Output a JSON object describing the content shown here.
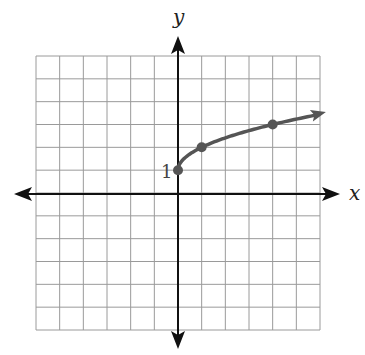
{
  "chart_data": {
    "type": "line",
    "title": "",
    "function": "y = sqrt(x) + 1",
    "xlabel": "x",
    "ylabel": "y",
    "xlim": [
      -6,
      6
    ],
    "ylim": [
      -6,
      6
    ],
    "grid": true,
    "grid_step": 1,
    "tick_labels": [
      {
        "axis": "y",
        "value": 1,
        "label": "1"
      }
    ],
    "series": [
      {
        "name": "curve",
        "x": [
          0,
          1,
          4,
          6
        ],
        "y": [
          1,
          2,
          3,
          3.45
        ],
        "marked_points": [
          [
            0,
            1
          ],
          [
            1,
            2
          ],
          [
            4,
            3
          ]
        ],
        "arrow_end": true,
        "color": "#555555"
      }
    ]
  },
  "labels": {
    "x_axis": "x",
    "y_axis": "y",
    "y_tick_1": "1"
  },
  "colors": {
    "grid": "#9a9a9a",
    "axis": "#111111",
    "curve": "#555555"
  }
}
